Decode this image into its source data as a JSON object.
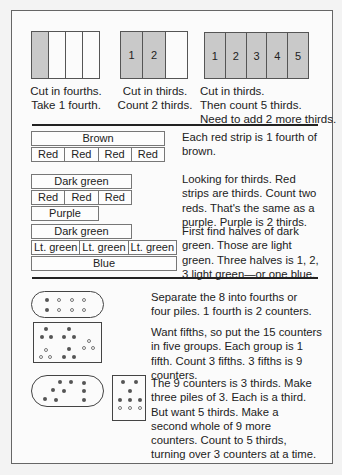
{
  "figures": [
    {
      "cells": [
        {
          "label": "",
          "shaded": true
        },
        {
          "label": "",
          "shaded": false
        },
        {
          "label": "",
          "shaded": false
        },
        {
          "label": "",
          "shaded": false
        }
      ],
      "caption": "Cut in fourths.\nTake 1 fourth."
    },
    {
      "cells": [
        {
          "label": "1",
          "shaded": true
        },
        {
          "label": "2",
          "shaded": true
        },
        {
          "label": "",
          "shaded": false
        }
      ],
      "caption": "Cut in thirds.\nCount 2 thirds."
    },
    {
      "cells": [
        {
          "label": "1",
          "shaded": true
        },
        {
          "label": "2",
          "shaded": true
        },
        {
          "label": "3",
          "shaded": true
        },
        {
          "label": "4",
          "shaded": true
        },
        {
          "label": "5",
          "shaded": true
        }
      ],
      "caption": "Cut in thirds.\nThen count 5 thirds.\nNeed to add 2 more thirds."
    }
  ],
  "strips": {
    "brown": {
      "whole": "Brown",
      "parts": [
        "Red",
        "Red",
        "Red",
        "Red"
      ],
      "text": "Each red strip is 1 fourth of brown."
    },
    "dark_green_thirds": {
      "whole": "Dark green",
      "parts": [
        "Red",
        "Red",
        "Red"
      ],
      "compare": "Purple",
      "text": "Looking for thirds. Red strips are thirds. Count two reds. That's the same as a purple. Purple is 2 thirds."
    },
    "dark_green_halves": {
      "whole": "Dark green",
      "parts": [
        "Lt. green",
        "Lt. green",
        "Lt. green"
      ],
      "compare": "Blue",
      "text": "First find halves of dark green. Those are light green. Three halves is 1, 2, 3 light green—or one blue."
    }
  },
  "counters": {
    "fourths": {
      "text": "Separate the 8 into fourths or four piles. 1 fourth is 2 counters."
    },
    "fifths": {
      "text": "Want fifths, so put the 15 counters in five groups. Each group is 1 fifth. Count 3 fifths. 3 fifths is 9 counters."
    },
    "thirds": {
      "text": "The 9 counters is 3 thirds. Make three piles of 3. Each is a third. But want 5 thirds. Make a second whole of 9 more counters. Count to 5 thirds, turning over 3 counters at a time."
    }
  }
}
